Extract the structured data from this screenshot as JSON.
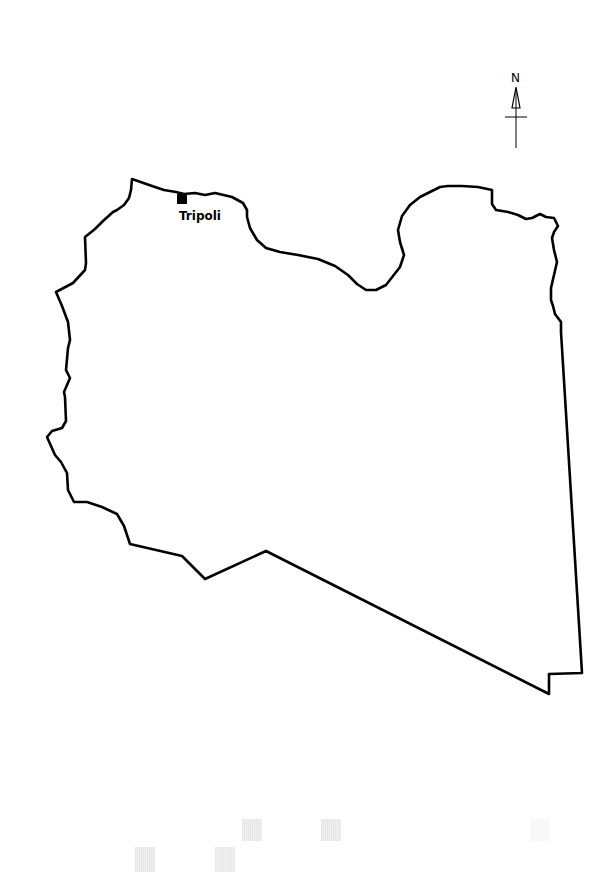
{
  "map": {
    "country_outline": "Libya",
    "outline_color": "#000000",
    "background_color": "#ffffff",
    "capital": {
      "name": "Tripoli",
      "marker": "filled-square",
      "marker_color": "#000000"
    },
    "north_arrow": {
      "label": "N"
    }
  }
}
